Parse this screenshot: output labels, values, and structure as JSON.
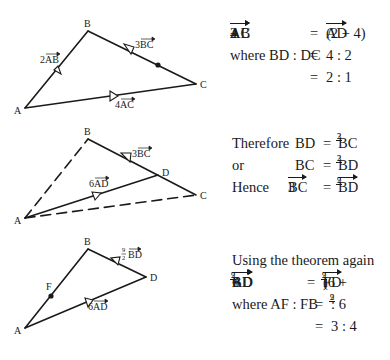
{
  "panels": [
    {
      "id": "panel-1",
      "diagram": {
        "points": {
          "A": [
            25,
            108
          ],
          "B": [
            88,
            31
          ],
          "C": [
            196,
            84
          ],
          "M": [
            158,
            65
          ]
        },
        "labels": {
          "A": "A",
          "B": "B",
          "C": "C"
        },
        "vector_labels": {
          "ab": "2AB",
          "bc": "3BC",
          "ac": "4AC"
        }
      },
      "equations": [
        {
          "lhs_a": "2",
          "lhs_av": "AB",
          "plus": "+",
          "lhs_b": "4",
          "lhs_bv": "AC",
          "eq": "=",
          "rhs": "(2 + 4)",
          "rhs_v": "AD"
        },
        {
          "text": "where  BD : DC",
          "eq": "=",
          "rhs": "4 : 2"
        },
        {
          "eq": "=",
          "rhs": "2 : 1"
        }
      ]
    },
    {
      "id": "panel-2",
      "diagram": {
        "points": {
          "A": [
            25,
            218
          ],
          "B": [
            88,
            139
          ],
          "C": [
            196,
            195
          ],
          "D": [
            158,
            175
          ]
        },
        "labels": {
          "A": "A",
          "B": "B",
          "C": "C",
          "D": "D"
        },
        "vector_labels": {
          "bc": "3BC",
          "ad": "6AD"
        }
      },
      "equations": [
        {
          "lead": "Therefore",
          "lhs": "BD",
          "eq": "=",
          "frac_num": "2",
          "frac_den": "3",
          "rhs": "BC"
        },
        {
          "lead": "or",
          "lhs": "BC",
          "eq": "=",
          "frac_num": "3",
          "frac_den": "2",
          "rhs": "BD"
        },
        {
          "lead": "Hence",
          "lhs_coef": "3",
          "lhs_v": "BC",
          "eq": "=",
          "frac_num": "9",
          "frac_den": "2",
          "rhs_v": "BD"
        }
      ]
    },
    {
      "id": "panel-3",
      "diagram": {
        "points": {
          "A": [
            25,
            328
          ],
          "B": [
            88,
            249
          ],
          "D": [
            146,
            277
          ],
          "F": [
            50,
            295
          ]
        },
        "labels": {
          "A": "A",
          "B": "B",
          "D": "D",
          "F": "F"
        },
        "vector_labels": {
          "bd_num": "9",
          "bd_den": "2",
          "bd": "BD",
          "ad": "6AD"
        }
      },
      "equations": [
        {
          "text": "Using the theorem again"
        },
        {
          "lhs_a": "6",
          "lhs_av": "AD",
          "plus": "+",
          "frac_num": "9",
          "frac_den": "2",
          "lhs_bv": "BD",
          "eq": "=",
          "rhs_open": "(6 +",
          "rhs_frac_num": "9",
          "rhs_frac_den": "2",
          "rhs_close": ")",
          "rhs_v": "FD"
        },
        {
          "text": "where  AF : FB",
          "eq": "=",
          "frac_num": "9",
          "frac_den": "2",
          "rhs": ": 6"
        },
        {
          "eq": "=",
          "rhs": "3 : 4"
        }
      ]
    }
  ]
}
